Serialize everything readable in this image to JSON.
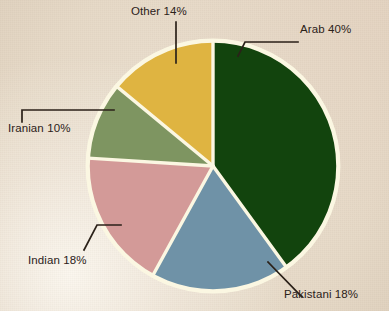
{
  "figure": {
    "background_color": "#e9dccb",
    "slice_separator_color": "#fbf7e2",
    "outline_color": "#fbf7e2",
    "leader_line_color": "#2b2119",
    "label_text_color": "#2b2119"
  },
  "chart_data": {
    "type": "pie",
    "title": "",
    "subtitle": "",
    "xlabel": "",
    "ylabel": "",
    "legend_position": "none",
    "grid": false,
    "total": 100,
    "units": "percent",
    "start_angle_deg": 0,
    "direction": "clockwise",
    "categories": [
      "Arab",
      "Pakistani",
      "Indian",
      "Iranian",
      "Other"
    ],
    "values": [
      40,
      18,
      18,
      10,
      14
    ],
    "labels": [
      "Arab 40%",
      "Pakistani 18%",
      "Indian 18%",
      "Iranian 10%",
      "Other 14%"
    ],
    "colors": [
      "#12440d",
      "#6f92a7",
      "#d39a98",
      "#7e9561",
      "#dfb441"
    ],
    "slices": [
      {
        "name": "Arab",
        "label": "Arab 40%",
        "value": 40,
        "color": "#12440d",
        "start_angle_deg": 0,
        "end_angle_deg": 144
      },
      {
        "name": "Pakistani",
        "label": "Pakistani 18%",
        "value": 18,
        "color": "#6f92a7",
        "start_angle_deg": 144,
        "end_angle_deg": 208.8
      },
      {
        "name": "Indian",
        "label": "Indian 18%",
        "value": 18,
        "color": "#d39a98",
        "start_angle_deg": 208.8,
        "end_angle_deg": 273.6
      },
      {
        "name": "Iranian",
        "label": "Iranian 10%",
        "value": 10,
        "color": "#7e9561",
        "start_angle_deg": 273.6,
        "end_angle_deg": 309.6
      },
      {
        "name": "Other",
        "label": "Other 14%",
        "value": 14,
        "color": "#dfb441",
        "start_angle_deg": 309.6,
        "end_angle_deg": 360
      }
    ]
  }
}
